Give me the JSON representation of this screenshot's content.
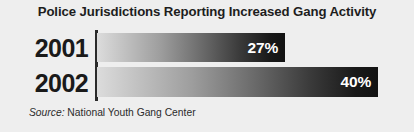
{
  "chart_data": {
    "type": "bar",
    "orientation": "horizontal",
    "title": "Police Jurisdictions Reporting Increased Gang Activity",
    "categories": [
      "2001",
      "2002"
    ],
    "values": [
      27,
      40
    ],
    "value_labels": [
      "27%",
      "40%"
    ],
    "xlabel": "",
    "ylabel": "",
    "xlim": [
      0,
      54
    ],
    "grid": false,
    "legend": null,
    "series": [
      {
        "name": "Percent of jurisdictions reporting increased gang activity",
        "values": [
          27,
          40
        ]
      }
    ],
    "bars": [
      {
        "category": "2001",
        "value": 27,
        "label": "27%"
      },
      {
        "category": "2002",
        "value": 40,
        "label": "40%"
      }
    ],
    "source": {
      "lead": "Source:",
      "text": " National Youth Gang Center"
    },
    "colors": {
      "background": "#eeeeee",
      "title": "#1d1d1d",
      "category_label": "#1a1a1a",
      "axis_line": "#2a2a2a",
      "bar_gradient_start": "#dcdcdc",
      "bar_gradient_end": "#121212",
      "value_label": "#ffffff",
      "source_text": "#2b2b2b"
    }
  }
}
